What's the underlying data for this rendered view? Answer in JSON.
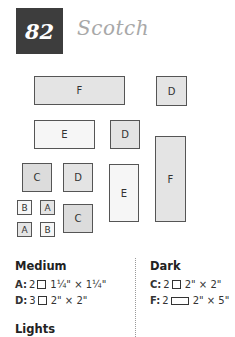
{
  "header": {
    "number": "82",
    "title": "Scotch"
  },
  "diagram": {
    "pieces": [
      {
        "label": "F",
        "shade": "medium"
      },
      {
        "label": "D",
        "shade": "medium"
      },
      {
        "label": "E",
        "shade": "light"
      },
      {
        "label": "D",
        "shade": "medium"
      },
      {
        "label": "F",
        "shade": "medium"
      },
      {
        "label": "C",
        "shade": "dark"
      },
      {
        "label": "D",
        "shade": "medium"
      },
      {
        "label": "E",
        "shade": "light"
      },
      {
        "label": "B",
        "shade": "light"
      },
      {
        "label": "A",
        "shade": "medium"
      },
      {
        "label": "A",
        "shade": "medium"
      },
      {
        "label": "B",
        "shade": "light"
      },
      {
        "label": "C",
        "shade": "dark"
      }
    ]
  },
  "cutting": {
    "medium": {
      "heading": "Medium",
      "items": [
        {
          "letter": "A:",
          "qty": "2",
          "shape": "square",
          "size": "1¼\" × 1¼\""
        },
        {
          "letter": "D:",
          "qty": "3",
          "shape": "square",
          "size": "2\" × 2\""
        }
      ]
    },
    "dark": {
      "heading": "Dark",
      "items": [
        {
          "letter": "C:",
          "qty": "2",
          "shape": "square",
          "size": "2\" × 2\""
        },
        {
          "letter": "F:",
          "qty": "2",
          "shape": "rectangle",
          "size": "2\" × 5\""
        }
      ]
    },
    "lights": {
      "heading": "Lights"
    }
  }
}
